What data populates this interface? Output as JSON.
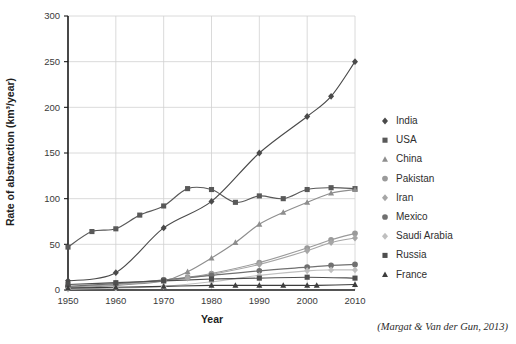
{
  "chart_data": {
    "type": "line",
    "title": "",
    "xlabel": "Year",
    "ylabel": "Rate of abstraction (km³/year)",
    "xlim": [
      1950,
      2010
    ],
    "ylim": [
      0,
      300
    ],
    "xticks": [
      1950,
      1960,
      1970,
      1980,
      1990,
      2000,
      2010
    ],
    "yticks": [
      0,
      50,
      100,
      150,
      200,
      250,
      300
    ],
    "grid": true,
    "legend_position": "right",
    "credit": "(Margat & Van der Gun, 2013)",
    "series": [
      {
        "name": "India",
        "marker": "diamond",
        "color": "#4a4a4a",
        "x": [
          1950,
          1960,
          1970,
          1980,
          1990,
          2000,
          2005,
          2010
        ],
        "values": [
          10,
          19,
          68,
          97,
          150,
          190,
          212,
          250
        ]
      },
      {
        "name": "USA",
        "marker": "square",
        "color": "#595959",
        "x": [
          1950,
          1955,
          1960,
          1965,
          1970,
          1975,
          1980,
          1985,
          1990,
          1995,
          2000,
          2005,
          2010
        ],
        "values": [
          47,
          64,
          67,
          82,
          92,
          111,
          110,
          96,
          103,
          100,
          110,
          112,
          111
        ]
      },
      {
        "name": "China",
        "marker": "triangle",
        "color": "#8e8e8e",
        "x": [
          1950,
          1960,
          1970,
          1975,
          1980,
          1985,
          1990,
          1995,
          2000,
          2005,
          2010
        ],
        "values": [
          2,
          5,
          10,
          20,
          35,
          52,
          72,
          85,
          96,
          106,
          110
        ]
      },
      {
        "name": "Pakistan",
        "marker": "circle",
        "color": "#9a9a9a",
        "x": [
          1950,
          1960,
          1970,
          1975,
          1980,
          1990,
          2000,
          2005,
          2010
        ],
        "values": [
          3,
          6,
          11,
          14,
          18,
          30,
          46,
          55,
          62
        ]
      },
      {
        "name": "Iran",
        "marker": "diamond",
        "color": "#a6a6a6",
        "x": [
          1950,
          1960,
          1970,
          1975,
          1980,
          1990,
          2000,
          2005,
          2010
        ],
        "values": [
          3,
          6,
          10,
          13,
          17,
          28,
          43,
          52,
          57
        ]
      },
      {
        "name": "Mexico",
        "marker": "circle",
        "color": "#707070",
        "x": [
          1950,
          1960,
          1970,
          1980,
          1990,
          2000,
          2005,
          2010
        ],
        "values": [
          4,
          7,
          11,
          16,
          21,
          25,
          27,
          28
        ]
      },
      {
        "name": "Saudi Arabia",
        "marker": "diamond",
        "color": "#bfbfbf",
        "x": [
          1950,
          1960,
          1970,
          1980,
          1990,
          2000,
          2005,
          2010
        ],
        "values": [
          1,
          2,
          4,
          9,
          16,
          21,
          22,
          22
        ]
      },
      {
        "name": "Russia",
        "marker": "square",
        "color": "#4f4f4f",
        "x": [
          1950,
          1960,
          1970,
          1980,
          1990,
          2000,
          2010
        ],
        "values": [
          6,
          8,
          10,
          12,
          13,
          14,
          13
        ]
      },
      {
        "name": "France",
        "marker": "triangle",
        "color": "#3d3d3d",
        "x": [
          1950,
          1960,
          1970,
          1980,
          1985,
          1990,
          1995,
          2000,
          2002,
          2010
        ],
        "values": [
          2,
          3,
          4,
          5,
          5,
          5,
          5,
          5,
          5,
          6
        ]
      }
    ]
  }
}
